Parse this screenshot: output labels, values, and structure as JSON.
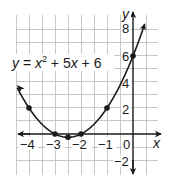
{
  "chart_data": {
    "type": "line",
    "title": "",
    "equation": "y = x^2 + 5x + 6",
    "equation_parts": {
      "y": "y",
      "eq": " = ",
      "x": "x",
      "exp": "2",
      "rest1": " + 5",
      "x2": "x",
      "rest2": " + 6"
    },
    "xlabel": "x",
    "ylabel": "y",
    "xlim": [
      -4.5,
      1
    ],
    "ylim": [
      -3,
      9
    ],
    "grid": true,
    "x_tick_labels": [
      "-4",
      "-3",
      "-2",
      "-1",
      "0"
    ],
    "y_tick_labels": [
      "8",
      "6",
      "4",
      "2",
      "-2"
    ],
    "series": [
      {
        "name": "y = x^2 + 5x + 6",
        "x": [
          -4,
          -3,
          -2.5,
          -2,
          -1,
          0
        ],
        "y": [
          2,
          0,
          -0.25,
          0,
          2,
          6
        ],
        "marked_points": true,
        "arrows_both_ends": true
      }
    ],
    "colors": {
      "curve": "#1a1a1a",
      "grid": "#b9b9b9",
      "axis": "#1a1a1a"
    }
  },
  "labels": {
    "x_axis": "x",
    "y_axis": "y",
    "x_ticks": {
      "m4": "−4",
      "m3": "−3",
      "m2": "−2",
      "m1": "−1",
      "zero": "0"
    },
    "y_ticks": {
      "p8": "8",
      "p6": "6",
      "p4": "4",
      "p2": "2",
      "m2": "−2"
    }
  }
}
